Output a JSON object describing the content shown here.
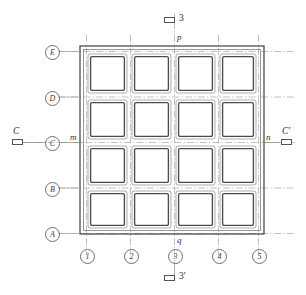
{
  "diagram": {
    "type": "architectural-grid-plan",
    "colors": {
      "line": "#4a4a4a",
      "grid_line": "#9a9a9a",
      "panel_outer": "#6e6e6e",
      "panel_inner": "#4a4a4a",
      "wall": "#3c3c3c",
      "background": "#ffffff"
    },
    "grid": {
      "row_labels": [
        "E",
        "D",
        "C",
        "B",
        "A"
      ],
      "column_labels": [
        "1",
        "2",
        "3",
        "4",
        "5"
      ],
      "rows": 4,
      "columns": 4
    },
    "point_labels": {
      "m": "m",
      "n": "n",
      "p": "p",
      "q": "q"
    },
    "section_markers": {
      "left": {
        "label": "C",
        "icon": "section-rect-icon"
      },
      "right": {
        "label": "C'",
        "icon": "section-rect-icon"
      },
      "top": {
        "label": "3",
        "icon": "section-rect-icon"
      },
      "bottom": {
        "label": "3'",
        "icon": "section-rect-icon"
      }
    },
    "panels": [
      [
        "panel-E4-1",
        "panel-E4-2",
        "panel-E4-3",
        "panel-E4-4"
      ],
      [
        "panel-D3-1",
        "panel-D3-2",
        "panel-D3-3",
        "panel-D3-4"
      ],
      [
        "panel-C2-1",
        "panel-C2-2",
        "panel-C2-3",
        "panel-C2-4"
      ],
      [
        "panel-B1-1",
        "panel-B1-2",
        "panel-B1-3",
        "panel-B1-4"
      ]
    ]
  }
}
